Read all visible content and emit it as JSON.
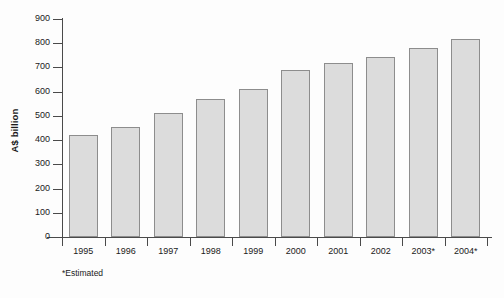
{
  "chart_data": {
    "type": "bar",
    "title": "",
    "subtitle": "",
    "xlabel": "",
    "ylabel": "A$ billion",
    "categories": [
      "1995",
      "1996",
      "1997",
      "1998",
      "1999",
      "2000",
      "2001",
      "2002",
      "2003*",
      "2004*"
    ],
    "values": [
      421,
      456,
      512,
      570,
      611,
      688,
      718,
      742,
      781,
      818
    ],
    "ylim": [
      0,
      900
    ],
    "ytick_interval": 100,
    "ytick_labels": [
      "0",
      "100",
      "200",
      "300",
      "400",
      "500",
      "600",
      "700",
      "800",
      "900"
    ],
    "grid": false,
    "legend": false,
    "legend_position": "none",
    "annotations": [
      "*Estimated"
    ],
    "bar_fill_color": "#dcdcdc",
    "bar_border_color": "#8d8d8d",
    "axis_color": "#4a4a4a",
    "background_color": "#fdfdfd"
  },
  "footnote": {
    "text": "*Estimated"
  }
}
